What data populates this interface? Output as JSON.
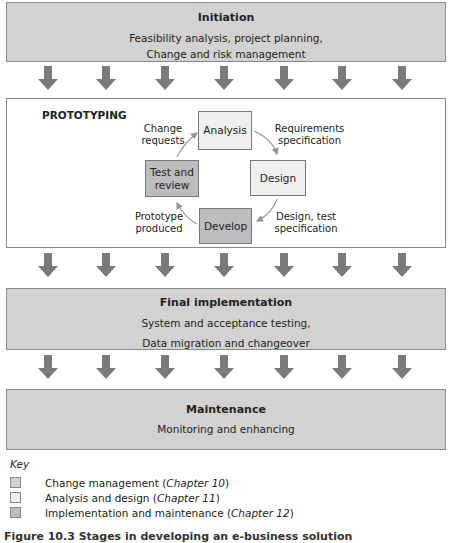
{
  "colors": {
    "change_management": "#d2d2d2",
    "analysis_design": "#efefef",
    "implementation_maintenance": "#bdbdbd",
    "arrow": "#7a7a7a",
    "border": "#8a8a8a"
  },
  "stages": {
    "initiation": {
      "title": "Initiation",
      "desc_line1": "Feasibility analysis, project planning,",
      "desc_line2": "Change and risk management"
    },
    "prototyping": {
      "title": "PROTOTYPING",
      "boxes": {
        "analysis": "Analysis",
        "design": "Design",
        "develop": "Develop",
        "test_review_line1": "Test and",
        "test_review_line2": "review"
      },
      "labels": {
        "change_requests_line1": "Change",
        "change_requests_line2": "requests",
        "requirements_line1": "Requirements",
        "requirements_line2": "specification",
        "design_test_line1": "Design, test",
        "design_test_line2": "specification",
        "prototype_line1": "Prototype",
        "prototype_line2": "produced"
      }
    },
    "final_implementation": {
      "title": "Final implementation",
      "desc_line1": "System and acceptance testing,",
      "desc_line2": "Data migration and changeover"
    },
    "maintenance": {
      "title": "Maintenance",
      "desc_line1": "Monitoring and enhancing"
    }
  },
  "arrows_per_row": 7,
  "key": {
    "title": "Key",
    "items": [
      {
        "label": "Change management (",
        "chapter": "Chapter 10",
        "close": ")"
      },
      {
        "label": "Analysis and design (",
        "chapter": "Chapter 11",
        "close": ")"
      },
      {
        "label": "Implementation and maintenance (",
        "chapter": "Chapter 12",
        "close": ")"
      }
    ]
  },
  "caption": "Figure 10.3  Stages in developing an e-business solution"
}
